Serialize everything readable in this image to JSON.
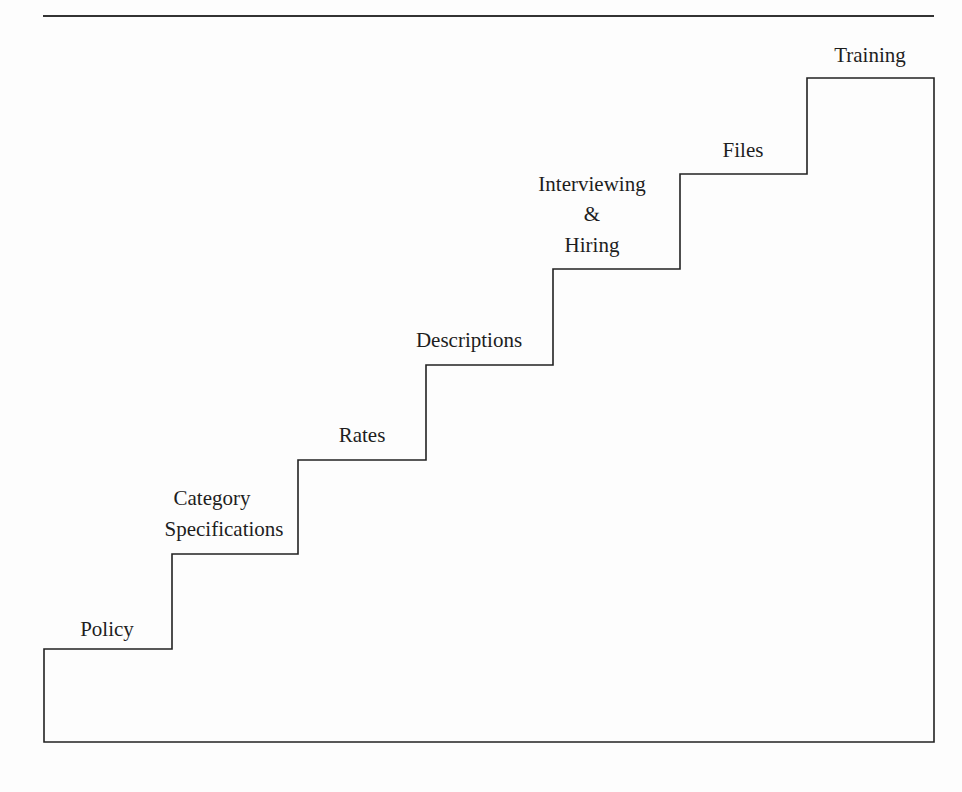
{
  "diagram": {
    "type": "staircase",
    "colors": {
      "line": "#222222",
      "text": "#1e1e1e",
      "background": "#fdfdfd"
    },
    "steps": [
      {
        "label_lines": [
          "Policy"
        ]
      },
      {
        "label_lines": [
          "Category",
          "Specifications"
        ]
      },
      {
        "label_lines": [
          "Rates"
        ]
      },
      {
        "label_lines": [
          "Descriptions"
        ]
      },
      {
        "label_lines": [
          "Interviewing",
          "&",
          "Hiring"
        ]
      },
      {
        "label_lines": [
          "Files"
        ]
      },
      {
        "label_lines": [
          "Training"
        ]
      }
    ]
  }
}
